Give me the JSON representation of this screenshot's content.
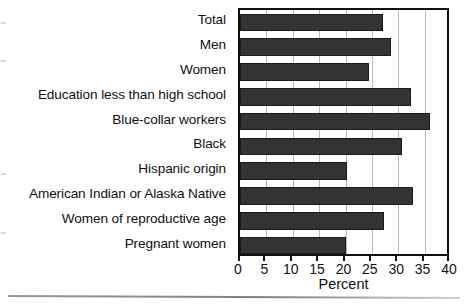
{
  "chart_data": {
    "type": "bar",
    "orientation": "horizontal",
    "title": "",
    "xlabel": "Percent",
    "ylabel": "",
    "xlim": [
      0,
      40
    ],
    "xticks": [
      0,
      5,
      10,
      15,
      20,
      25,
      30,
      35,
      40
    ],
    "xticklabels": [
      "0",
      "5",
      "10",
      "15",
      "20",
      "25",
      "30",
      "35",
      "40"
    ],
    "grid": "vertical gridlines at every x tick",
    "legend": "none",
    "bar_color": "#333333",
    "categories": [
      "Total",
      "Men",
      "Women",
      "Education less than high school",
      "Blue-collar workers",
      "Black",
      "Hispanic origin",
      "American Indian or Alaska Native",
      "Women of reproductive age",
      "Pregnant women"
    ],
    "values": [
      27.1,
      28.6,
      24.5,
      32.5,
      36.1,
      30.7,
      20.3,
      32.8,
      27.3,
      20.1
    ]
  }
}
